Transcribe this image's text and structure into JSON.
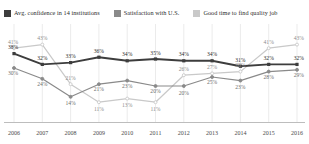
{
  "legend": {
    "items": [
      {
        "label": "Avg. confidence in 14 institutions",
        "color": "#3d3d3d",
        "key": "confidence"
      },
      {
        "label": "Satisfaction with U.S.",
        "color": "#8a8a8a",
        "key": "satisfaction"
      },
      {
        "label": "Good time to find quality job",
        "color": "#c9c9c9",
        "key": "goodjob"
      }
    ]
  },
  "axis": {
    "x_ticks": [
      "2006",
      "2007",
      "2008",
      "2009",
      "2010",
      "2011",
      "2012",
      "2013",
      "2014",
      "2015",
      "2016"
    ]
  },
  "chart_data": {
    "type": "line",
    "title": "",
    "subtitle": "",
    "xlabel": "",
    "ylabel": "",
    "ylim": [
      0,
      50
    ],
    "grid": true,
    "grid_orientation": "vertical",
    "legend_position": "top",
    "value_suffix": "%",
    "x": [
      "2006",
      "2007",
      "2008",
      "2009",
      "2010",
      "2011",
      "2012",
      "2013",
      "2014",
      "2015",
      "2016"
    ],
    "series": [
      {
        "name": "Avg. confidence in 14 institutions",
        "color": "#3d3d3d",
        "values": [
          38,
          32,
          33,
          36,
          34,
          35,
          34,
          34,
          31,
          32,
          32
        ],
        "labels": [
          "38%",
          "32%",
          "33%",
          "36%",
          "34%",
          "35%",
          "34%",
          "34%",
          "31%",
          "32%",
          "32%"
        ]
      },
      {
        "name": "Satisfaction with U.S.",
        "color": "#8a8a8a",
        "values": [
          30,
          24,
          14,
          21,
          23,
          20,
          20,
          25,
          23,
          28,
          29
        ],
        "labels": [
          "30%",
          "24%",
          "14%",
          "21%",
          "23%",
          "20%",
          "20%",
          "25%",
          "23%",
          "28%",
          "29%"
        ]
      },
      {
        "name": "Good time to find quality job",
        "color": "#c9c9c9",
        "values": [
          41,
          43,
          21,
          11,
          13,
          11,
          26,
          27,
          28,
          41,
          43
        ],
        "labels": [
          "41%",
          "43%",
          "21%",
          "11%",
          "13%",
          "11%",
          "26%",
          "27%",
          "28%",
          "41%",
          "43%"
        ]
      }
    ]
  }
}
